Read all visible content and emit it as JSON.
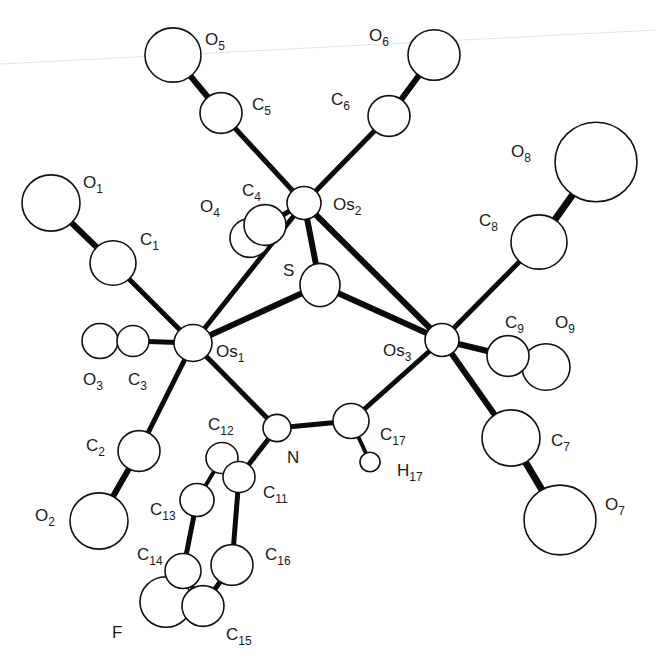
{
  "figure": {
    "colors": {
      "atom_fill": "#ffffff",
      "atom_stroke": "#111111",
      "bond": "#0a0a0a",
      "background": "#ffffff"
    }
  },
  "atoms": [
    {
      "id": "O5",
      "el": "O",
      "sub": "5",
      "x": 173,
      "y": 55,
      "r": 28,
      "lx": 205,
      "ly": 45
    },
    {
      "id": "C5",
      "el": "C",
      "sub": "5",
      "x": 221,
      "y": 113,
      "r": 21,
      "lx": 252,
      "ly": 110
    },
    {
      "id": "O6",
      "el": "O",
      "sub": "6",
      "x": 434,
      "y": 55,
      "r": 26,
      "lx": 369,
      "ly": 41
    },
    {
      "id": "C6",
      "el": "C",
      "sub": "6",
      "x": 389,
      "y": 116,
      "r": 21,
      "lx": 331,
      "ly": 105
    },
    {
      "id": "O1",
      "el": "O",
      "sub": "1",
      "x": 51,
      "y": 203,
      "r": 29,
      "lx": 83,
      "ly": 188
    },
    {
      "id": "C1",
      "el": "C",
      "sub": "1",
      "x": 113,
      "y": 263,
      "r": 23,
      "lx": 140,
      "ly": 245
    },
    {
      "id": "O4",
      "el": "O",
      "sub": "4",
      "x": 250,
      "y": 238,
      "r": 20,
      "lx": 200,
      "ly": 212
    },
    {
      "id": "C4",
      "el": "C",
      "sub": "4",
      "x": 265,
      "y": 225,
      "r": 21,
      "lx": 242,
      "ly": 196
    },
    {
      "id": "Os2",
      "el": "Os",
      "sub": "2",
      "x": 304,
      "y": 203,
      "r": 17,
      "lx": 333,
      "ly": 210
    },
    {
      "id": "S",
      "el": "S",
      "sub": "",
      "x": 320,
      "y": 285,
      "r": 20,
      "lx": 283,
      "ly": 276
    },
    {
      "id": "O8",
      "el": "O",
      "sub": "8",
      "x": 596,
      "y": 162,
      "r": 41,
      "lx": 511,
      "ly": 157
    },
    {
      "id": "C8",
      "el": "C",
      "sub": "8",
      "x": 539,
      "y": 242,
      "r": 28,
      "lx": 479,
      "ly": 226
    },
    {
      "id": "O3",
      "el": "O",
      "sub": "3",
      "x": 100,
      "y": 341,
      "r": 18,
      "lx": 83,
      "ly": 385
    },
    {
      "id": "C3",
      "el": "C",
      "sub": "3",
      "x": 133,
      "y": 341,
      "r": 16,
      "lx": 128,
      "ly": 385
    },
    {
      "id": "Os1",
      "el": "Os",
      "sub": "1",
      "x": 193,
      "y": 343,
      "r": 19,
      "lx": 216,
      "ly": 357
    },
    {
      "id": "Os3",
      "el": "Os",
      "sub": "3",
      "x": 442,
      "y": 340,
      "r": 17,
      "lx": 383,
      "ly": 356
    },
    {
      "id": "C9",
      "el": "C",
      "sub": "9",
      "x": 508,
      "y": 356,
      "r": 21,
      "lx": 505,
      "ly": 328
    },
    {
      "id": "O9",
      "el": "O",
      "sub": "9",
      "x": 546,
      "y": 367,
      "r": 24,
      "lx": 555,
      "ly": 328
    },
    {
      "id": "N",
      "el": "N",
      "sub": "",
      "x": 277,
      "y": 428,
      "r": 14,
      "lx": 287,
      "ly": 463
    },
    {
      "id": "C17",
      "el": "C",
      "sub": "17",
      "x": 351,
      "y": 421,
      "r": 18,
      "lx": 380,
      "ly": 440
    },
    {
      "id": "H17",
      "el": "H",
      "sub": "17",
      "x": 370,
      "y": 462,
      "r": 10,
      "lx": 397,
      "ly": 476
    },
    {
      "id": "C7",
      "el": "C",
      "sub": "7",
      "x": 511,
      "y": 438,
      "r": 29,
      "lx": 551,
      "ly": 446
    },
    {
      "id": "O7",
      "el": "O",
      "sub": "7",
      "x": 560,
      "y": 520,
      "r": 36,
      "lx": 605,
      "ly": 510
    },
    {
      "id": "C2",
      "el": "C",
      "sub": "2",
      "x": 139,
      "y": 451,
      "r": 21,
      "lx": 86,
      "ly": 451
    },
    {
      "id": "O2",
      "el": "O",
      "sub": "2",
      "x": 99,
      "y": 521,
      "r": 29,
      "lx": 35,
      "ly": 521
    },
    {
      "id": "C12",
      "el": "C",
      "sub": "12",
      "x": 222,
      "y": 458,
      "r": 16,
      "lx": 208,
      "ly": 430
    },
    {
      "id": "C11",
      "el": "C",
      "sub": "11",
      "x": 239,
      "y": 477,
      "r": 16,
      "lx": 263,
      "ly": 498
    },
    {
      "id": "C13",
      "el": "C",
      "sub": "13",
      "x": 197,
      "y": 500,
      "r": 17,
      "lx": 150,
      "ly": 515
    },
    {
      "id": "C16",
      "el": "C",
      "sub": "16",
      "x": 232,
      "y": 565,
      "r": 21,
      "lx": 265,
      "ly": 560
    },
    {
      "id": "C14",
      "el": "C",
      "sub": "14",
      "x": 183,
      "y": 571,
      "r": 18,
      "lx": 137,
      "ly": 560
    },
    {
      "id": "F",
      "el": "F",
      "sub": "",
      "x": 166,
      "y": 602,
      "r": 26,
      "lx": 112,
      "ly": 638
    },
    {
      "id": "C15",
      "el": "C",
      "sub": "15",
      "x": 203,
      "y": 606,
      "r": 21,
      "lx": 226,
      "ly": 640
    }
  ],
  "bonds": [
    [
      "O5",
      "C5",
      6
    ],
    [
      "C5",
      "Os2",
      5
    ],
    [
      "O6",
      "C6",
      6
    ],
    [
      "C6",
      "Os2",
      5
    ],
    [
      "O1",
      "C1",
      6
    ],
    [
      "C1",
      "Os1",
      5
    ],
    [
      "O3",
      "C3",
      4
    ],
    [
      "C3",
      "Os1",
      5
    ],
    [
      "O2",
      "C2",
      6
    ],
    [
      "C2",
      "Os1",
      5
    ],
    [
      "O4",
      "C4",
      4
    ],
    [
      "C4",
      "Os2",
      5
    ],
    [
      "O8",
      "C8",
      7
    ],
    [
      "C8",
      "Os3",
      5
    ],
    [
      "O9",
      "C9",
      4
    ],
    [
      "C9",
      "Os3",
      6
    ],
    [
      "O7",
      "C7",
      7
    ],
    [
      "C7",
      "Os3",
      6
    ],
    [
      "Os1",
      "Os2",
      5
    ],
    [
      "Os2",
      "Os3",
      6
    ],
    [
      "Os2",
      "S",
      6
    ],
    [
      "Os1",
      "S",
      6
    ],
    [
      "S",
      "Os3",
      6
    ],
    [
      "Os1",
      "N",
      5
    ],
    [
      "N",
      "C17",
      5
    ],
    [
      "C17",
      "Os3",
      5
    ],
    [
      "C17",
      "H17",
      4
    ],
    [
      "N",
      "C11",
      5
    ],
    [
      "C11",
      "C12",
      4
    ],
    [
      "C12",
      "C13",
      4
    ],
    [
      "C13",
      "C14",
      5
    ],
    [
      "C14",
      "C15",
      4
    ],
    [
      "C15",
      "C16",
      5
    ],
    [
      "C16",
      "C11",
      5
    ],
    [
      "C14",
      "F",
      5
    ]
  ]
}
